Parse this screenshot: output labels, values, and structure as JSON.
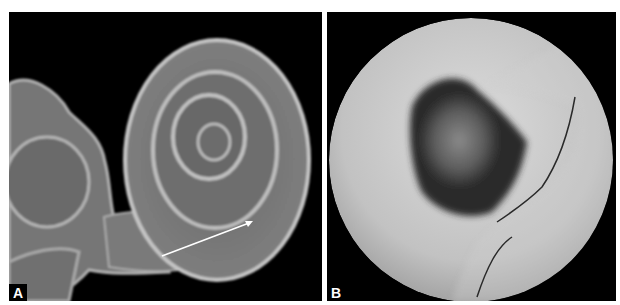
{
  "figure": {
    "panels": [
      {
        "id": "A",
        "label": "A",
        "description": "3D CT rendering of the inner ear: cochlea spiral with vestibule and semicircular canals on black background; white arrow pointing along basal turn",
        "background": "#000000",
        "annotation": {
          "type": "arrow",
          "color": "#ffffff",
          "from": [
            162,
            252
          ],
          "to": [
            249,
            220
          ]
        }
      },
      {
        "id": "B",
        "label": "B",
        "description": "Virtual endoscopy view (circular grayscale fisheye) inside the cochlea / round window region",
        "background": "#000000"
      }
    ]
  }
}
